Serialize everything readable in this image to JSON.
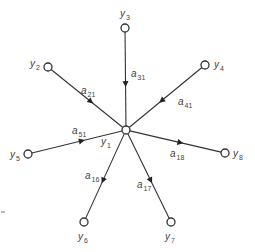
{
  "diagram": {
    "center": {
      "id": "y1",
      "label": "y",
      "sub": "1"
    },
    "nodes": [
      {
        "id": "y2",
        "label": "y",
        "sub": "2"
      },
      {
        "id": "y3",
        "label": "y",
        "sub": "3"
      },
      {
        "id": "y4",
        "label": "y",
        "sub": "4"
      },
      {
        "id": "y5",
        "label": "y",
        "sub": "5"
      },
      {
        "id": "y6",
        "label": "y",
        "sub": "6"
      },
      {
        "id": "y7",
        "label": "y",
        "sub": "7"
      },
      {
        "id": "y8",
        "label": "y",
        "sub": "8"
      }
    ],
    "edges": [
      {
        "from": "y2",
        "to": "y1",
        "label": "a",
        "sub": "21"
      },
      {
        "from": "y3",
        "to": "y1",
        "label": "a",
        "sub": "31"
      },
      {
        "from": "y4",
        "to": "y1",
        "label": "a",
        "sub": "41"
      },
      {
        "from": "y5",
        "to": "y1",
        "label": "a",
        "sub": "51"
      },
      {
        "from": "y1",
        "to": "y6",
        "label": "a",
        "sub": "16"
      },
      {
        "from": "y1",
        "to": "y7",
        "label": "a",
        "sub": "17"
      },
      {
        "from": "y1",
        "to": "y8",
        "label": "a",
        "sub": "18"
      }
    ]
  }
}
